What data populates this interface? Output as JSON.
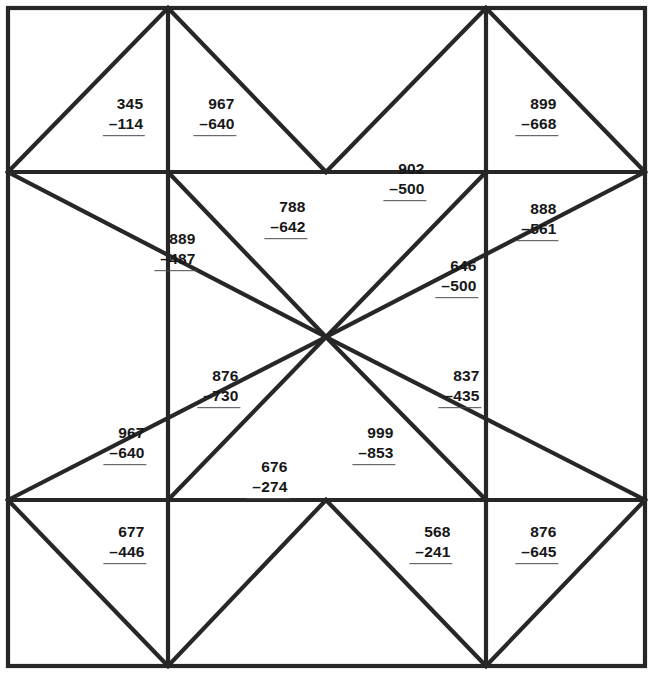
{
  "worksheet": {
    "title": "Subtraction Quilt",
    "canvas": {
      "width": 652,
      "height": 674
    },
    "line_color": "#272727",
    "text_color": "#171717",
    "rule_color": "#4a4a52",
    "background": "#ffffff"
  },
  "problems": [
    {
      "id": "p01",
      "minuend": "345",
      "subtrahend": "–114",
      "x": 124,
      "y": 115
    },
    {
      "id": "p02",
      "minuend": "967",
      "subtrahend": "–640",
      "x": 215,
      "y": 115
    },
    {
      "id": "p03",
      "minuend": "899",
      "subtrahend": "–668",
      "x": 537,
      "y": 115
    },
    {
      "id": "p04",
      "minuend": "902",
      "subtrahend": "–500",
      "x": 405,
      "y": 180
    },
    {
      "id": "p05",
      "minuend": "788",
      "subtrahend": "–642",
      "x": 286,
      "y": 218
    },
    {
      "id": "p06",
      "minuend": "888",
      "subtrahend": "–561",
      "x": 537,
      "y": 220
    },
    {
      "id": "p07",
      "minuend": "889",
      "subtrahend": "–487",
      "x": 176,
      "y": 250
    },
    {
      "id": "p08",
      "minuend": "646",
      "subtrahend": "–500",
      "x": 457,
      "y": 277
    },
    {
      "id": "p09",
      "minuend": "876",
      "subtrahend": "–730",
      "x": 219,
      "y": 387
    },
    {
      "id": "p10",
      "minuend": "837",
      "subtrahend": "–435",
      "x": 460,
      "y": 387
    },
    {
      "id": "p11",
      "minuend": "967",
      "subtrahend": "–640",
      "x": 125,
      "y": 444
    },
    {
      "id": "p12",
      "minuend": "999",
      "subtrahend": "–853",
      "x": 374,
      "y": 444
    },
    {
      "id": "p13",
      "minuend": "676",
      "subtrahend": "–274",
      "x": 268,
      "y": 478
    },
    {
      "id": "p14",
      "minuend": "677",
      "subtrahend": "–446",
      "x": 125,
      "y": 543
    },
    {
      "id": "p15",
      "minuend": "568",
      "subtrahend": "–241",
      "x": 431,
      "y": 543
    },
    {
      "id": "p16",
      "minuend": "876",
      "subtrahend": "–645",
      "x": 537,
      "y": 543
    }
  ],
  "geometry": {
    "border": {
      "x": 8,
      "y": 8,
      "w": 637,
      "h": 658
    },
    "nodes": {
      "top_left_corner": [
        8,
        8
      ],
      "top_right_corner": [
        645,
        8
      ],
      "bottom_left_corner": [
        8,
        666
      ],
      "bottom_right_corner": [
        645,
        666
      ],
      "top_a": [
        168,
        8
      ],
      "top_b": [
        486,
        8
      ],
      "bottom_a": [
        168,
        666
      ],
      "bottom_b": [
        486,
        666
      ],
      "left_a": [
        8,
        172
      ],
      "left_b": [
        8,
        500
      ],
      "right_a": [
        645,
        172
      ],
      "right_b": [
        645,
        500
      ],
      "center": [
        326,
        337
      ],
      "inner_tl": [
        168,
        172
      ],
      "inner_tr": [
        486,
        172
      ],
      "inner_bl": [
        168,
        500
      ],
      "inner_br": [
        486,
        500
      ]
    },
    "segments": [
      {
        "name": "h-upper",
        "from": [
          8,
          172
        ],
        "to": [
          645,
          172
        ]
      },
      {
        "name": "h-lower",
        "from": [
          8,
          500
        ],
        "to": [
          645,
          500
        ]
      },
      {
        "name": "v-left",
        "from": [
          168,
          8
        ],
        "to": [
          168,
          666
        ]
      },
      {
        "name": "v-right",
        "from": [
          486,
          8
        ],
        "to": [
          486,
          666
        ]
      },
      {
        "name": "d-tl-in",
        "from": [
          8,
          172
        ],
        "to": [
          168,
          8
        ]
      },
      {
        "name": "d-tl-out",
        "from": [
          168,
          8
        ],
        "to": [
          326,
          172
        ]
      },
      {
        "name": "d-tr-in",
        "from": [
          486,
          8
        ],
        "to": [
          645,
          172
        ]
      },
      {
        "name": "d-tr-out",
        "from": [
          326,
          172
        ],
        "to": [
          486,
          8
        ]
      },
      {
        "name": "d-bl-in",
        "from": [
          8,
          500
        ],
        "to": [
          168,
          666
        ]
      },
      {
        "name": "d-bl-out",
        "from": [
          168,
          666
        ],
        "to": [
          326,
          500
        ]
      },
      {
        "name": "d-br-in",
        "from": [
          486,
          666
        ],
        "to": [
          645,
          500
        ]
      },
      {
        "name": "d-br-out",
        "from": [
          326,
          500
        ],
        "to": [
          486,
          666
        ]
      },
      {
        "name": "d-lt",
        "from": [
          8,
          172
        ],
        "to": [
          326,
          337
        ]
      },
      {
        "name": "d-lb",
        "from": [
          8,
          500
        ],
        "to": [
          326,
          337
        ]
      },
      {
        "name": "d-rt",
        "from": [
          645,
          172
        ],
        "to": [
          326,
          337
        ]
      },
      {
        "name": "d-rb",
        "from": [
          645,
          500
        ],
        "to": [
          326,
          337
        ]
      },
      {
        "name": "d-center-tl",
        "from": [
          168,
          172
        ],
        "to": [
          326,
          337
        ]
      },
      {
        "name": "d-center-tr",
        "from": [
          486,
          172
        ],
        "to": [
          326,
          337
        ]
      },
      {
        "name": "d-center-bl",
        "from": [
          168,
          500
        ],
        "to": [
          326,
          337
        ]
      },
      {
        "name": "d-center-br",
        "from": [
          486,
          500
        ],
        "to": [
          326,
          337
        ]
      }
    ]
  }
}
